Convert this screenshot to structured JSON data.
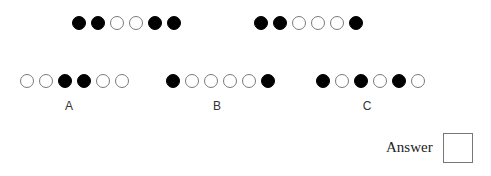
{
  "puzzle": {
    "sequence": [
      {
        "id": "seq-1",
        "pattern": [
          "filled",
          "filled",
          "empty",
          "empty",
          "filled",
          "filled"
        ]
      },
      {
        "id": "seq-2",
        "pattern": [
          "filled",
          "filled",
          "empty",
          "empty",
          "empty",
          "filled"
        ]
      }
    ],
    "options": [
      {
        "label": "A",
        "pattern": [
          "empty",
          "empty",
          "filled",
          "filled",
          "empty",
          "empty"
        ]
      },
      {
        "label": "B",
        "pattern": [
          "filled",
          "empty",
          "empty",
          "empty",
          "empty",
          "filled"
        ]
      },
      {
        "label": "C",
        "pattern": [
          "filled",
          "empty",
          "filled",
          "empty",
          "filled",
          "empty"
        ]
      }
    ],
    "answer_label": "Answer",
    "answer_value": ""
  }
}
